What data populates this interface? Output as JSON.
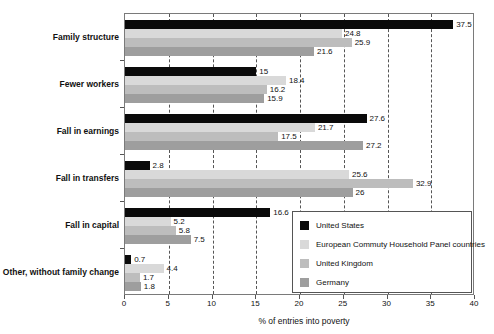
{
  "chart_data": {
    "type": "bar",
    "orientation": "horizontal",
    "title": "",
    "xlabel": "% of entries into poverty",
    "ylabel": "",
    "xlim": [
      0,
      40
    ],
    "xticks": [
      0,
      5,
      10,
      15,
      20,
      25,
      30,
      35,
      40
    ],
    "grid": "vertical-dashed",
    "legend_position": "lower-right-inside",
    "categories": [
      "Family structure",
      "Fewer workers",
      "Fall in earnings",
      "Fall in transfers",
      "Fall in capital",
      "Other, without family change"
    ],
    "series": [
      {
        "name": "United States",
        "color": "#0a0a0a",
        "values": [
          37.5,
          15,
          27.6,
          2.8,
          16.6,
          0.7
        ],
        "labels": [
          "37.5",
          "15",
          "27.6",
          "2.8",
          "16.6",
          "0.7"
        ]
      },
      {
        "name": "European Commuty Household Panel countries",
        "color": "#d9d9d9",
        "values": [
          24.8,
          18.4,
          21.7,
          25.6,
          5.2,
          4.4
        ],
        "labels": [
          "24.8",
          "18.4",
          "21.7",
          "25.6",
          "5.2",
          "4.4"
        ]
      },
      {
        "name": "United Kingdom",
        "color": "#bdbdbd",
        "values": [
          25.9,
          16.2,
          17.5,
          32.9,
          5.8,
          1.7
        ],
        "labels": [
          "25.9",
          "16.2",
          "17.5",
          "32.9",
          "5.8",
          "1.7"
        ]
      },
      {
        "name": "Germany",
        "color": "#9e9e9e",
        "values": [
          21.6,
          15.9,
          27.2,
          26,
          7.5,
          1.8
        ],
        "labels": [
          "21.6",
          "15.9",
          "27.2",
          "26",
          "7.5",
          "1.8"
        ]
      }
    ]
  },
  "axis": {
    "tick_labels": [
      "0",
      "5",
      "10",
      "15",
      "20",
      "25",
      "30",
      "35",
      "40"
    ],
    "title": "% of entries into poverty"
  },
  "legend": {
    "entries": [
      {
        "label": "United States",
        "swatch": "us"
      },
      {
        "label": "European Commuty Household Panel countries",
        "swatch": "echp"
      },
      {
        "label": "United Kingdom",
        "swatch": "uk"
      },
      {
        "label": "Germany",
        "swatch": "de"
      }
    ]
  }
}
